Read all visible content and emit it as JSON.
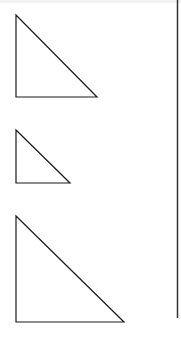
{
  "diagram": {
    "stroke_color": "#1a1a1a",
    "divider_color": "#333333",
    "background": "#ffffff",
    "triangles": [
      {
        "name": "large-top",
        "points": "16,15 16,97 97,97"
      },
      {
        "name": "small-middle",
        "points": "16,130 16,183 70,183"
      },
      {
        "name": "large-bottom",
        "points": "16,216 16,322 124,322"
      }
    ],
    "divider": {
      "x": 177.5,
      "y1": 0,
      "y2": 318
    }
  }
}
